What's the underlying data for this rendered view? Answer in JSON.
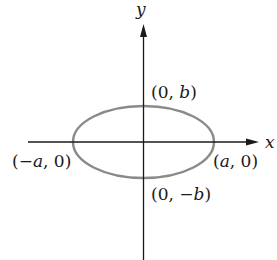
{
  "diagram": {
    "type": "ellipse-on-axes",
    "axes": {
      "x_label": "x",
      "y_label": "y",
      "axis_color": "#1a1a1a"
    },
    "ellipse": {
      "stroke_color": "#8a8a8a",
      "center": "(0, 0)"
    },
    "points": {
      "top": {
        "open": "(0, ",
        "var": "b",
        "close": ")"
      },
      "bottom": {
        "open": "(0, −",
        "var": "b",
        "close": ")"
      },
      "left": {
        "open": "(−",
        "var": "a",
        "close": ", 0)"
      },
      "right": {
        "open": "(",
        "var": "a",
        "close": ", 0)"
      }
    }
  }
}
